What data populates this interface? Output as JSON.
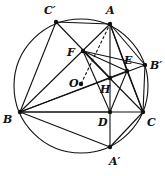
{
  "diagram": {
    "type": "geometry",
    "circle": {
      "cx": 81,
      "cy": 86,
      "r": 67
    },
    "points": {
      "A": {
        "label": "A",
        "x": 110,
        "y": 24,
        "lx": 106,
        "ly": 14
      },
      "C'": {
        "label": "C′",
        "x": 56,
        "y": 22,
        "lx": 44,
        "ly": 14
      },
      "F": {
        "label": "F",
        "x": 83,
        "y": 51,
        "lx": 67,
        "ly": 56
      },
      "E": {
        "label": "E",
        "x": 127,
        "y": 71,
        "lx": 124,
        "ly": 64
      },
      "B'": {
        "label": "B′",
        "x": 145,
        "y": 65,
        "lx": 150,
        "ly": 69
      },
      "O": {
        "label": "O",
        "x": 81,
        "y": 84,
        "lx": 69,
        "ly": 87
      },
      "H": {
        "label": "H",
        "x": 110,
        "y": 78,
        "lx": 100,
        "ly": 93
      },
      "B": {
        "label": "B",
        "x": 20,
        "y": 112,
        "lx": 3,
        "ly": 123
      },
      "D": {
        "label": "D",
        "x": 110,
        "y": 112,
        "lx": 98,
        "ly": 126
      },
      "C": {
        "label": "C",
        "x": 143,
        "y": 112,
        "lx": 147,
        "ly": 126
      },
      "A'": {
        "label": "A′",
        "x": 110,
        "y": 147,
        "lx": 109,
        "ly": 165
      }
    },
    "segments": [
      [
        "C'",
        "A"
      ],
      [
        "C'",
        "B"
      ],
      [
        "C'",
        "H"
      ],
      [
        "A",
        "B"
      ],
      [
        "A",
        "D"
      ],
      [
        "A",
        "C"
      ],
      [
        "A",
        "E"
      ],
      [
        "A",
        "B'"
      ],
      [
        "B",
        "C"
      ],
      [
        "B",
        "E"
      ],
      [
        "B",
        "B'"
      ],
      [
        "B",
        "A'"
      ],
      [
        "B",
        "D"
      ],
      [
        "F",
        "C"
      ],
      [
        "F",
        "D"
      ],
      [
        "F",
        "E"
      ],
      [
        "E",
        "D"
      ],
      [
        "E",
        "C"
      ],
      [
        "B'",
        "C"
      ],
      [
        "D",
        "A'"
      ],
      [
        "C",
        "A'"
      ],
      [
        "F",
        "B'"
      ]
    ],
    "dashed_segments": [
      [
        "O",
        "A"
      ]
    ]
  }
}
